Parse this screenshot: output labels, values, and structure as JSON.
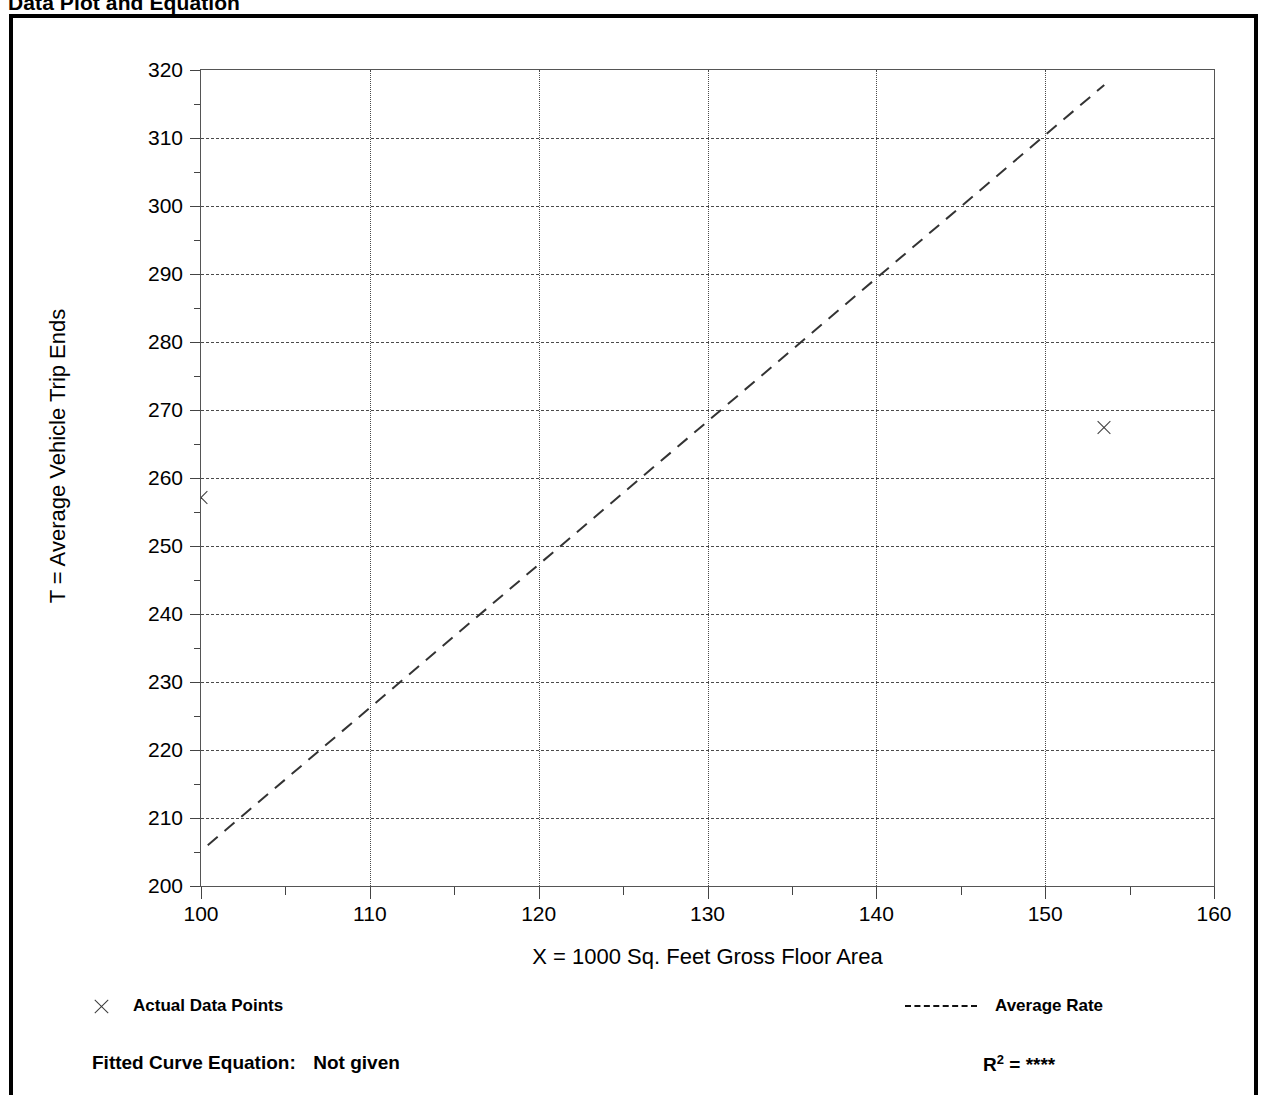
{
  "page": {
    "title": "Data Plot and Equation",
    "title_right": ""
  },
  "chart_data": {
    "type": "scatter",
    "title": "Data Plot and Equation",
    "xlabel": "X = 1000 Sq. Feet Gross Floor Area",
    "ylabel": "T = Average Vehicle Trip Ends",
    "xlim": [
      100,
      160
    ],
    "ylim": [
      200,
      320
    ],
    "xticks": [
      100,
      110,
      120,
      130,
      140,
      150,
      160
    ],
    "xticks_minor": [
      105,
      115,
      125,
      135,
      145,
      155
    ],
    "yticks": [
      200,
      210,
      220,
      230,
      240,
      250,
      260,
      270,
      280,
      290,
      300,
      310,
      320
    ],
    "yticks_minor": [
      205,
      215,
      225,
      235,
      245,
      255,
      265,
      275,
      285,
      295,
      305,
      315
    ],
    "grid": true,
    "legend_position": "below-axes",
    "series": [
      {
        "name": "Actual Data Points",
        "type": "scatter",
        "marker": "x",
        "points": [
          {
            "x": 100.0,
            "y": 257.0
          },
          {
            "x": 153.5,
            "y": 267.3
          }
        ]
      },
      {
        "name": "Average Rate",
        "type": "line",
        "style": "dashed",
        "points": [
          {
            "x": 100.4,
            "y": 206.0
          },
          {
            "x": 153.5,
            "y": 317.8
          }
        ]
      }
    ]
  },
  "legend": {
    "data_points_label": "Actual Data Points",
    "average_rate_label": "Average Rate"
  },
  "footer": {
    "equation_label": "Fitted Curve Equation:",
    "equation_value": "Not given",
    "r2_label": "R",
    "r2_exponent": "2",
    "r2_equals": "=",
    "r2_value": "****"
  },
  "colors": {
    "frame": "#000000",
    "axis": "#555555",
    "grid": "#4a4a4a",
    "marker": "#3c3c3c",
    "background": "#ffffff"
  }
}
